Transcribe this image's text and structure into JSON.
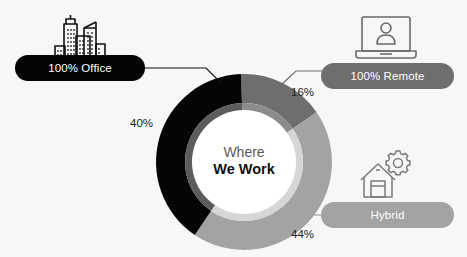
{
  "colors": {
    "office": "#050505",
    "remote": "#6e6e6e",
    "hybrid": "#a3a3a3",
    "inner_office": "#5c5c5c",
    "inner_remote": "#8c8c8c",
    "inner_hybrid": "#d6d6d6",
    "background": "#f7f7f7",
    "icon": "#6a6a6a",
    "icon_office": "#111111"
  },
  "center": {
    "line1": "Where",
    "line2": "We Work"
  },
  "categories": [
    {
      "key": "office",
      "label": "100% Office",
      "percent_label": "40%",
      "icon": "city-buildings-icon"
    },
    {
      "key": "remote",
      "label": "100% Remote",
      "percent_label": "16%",
      "icon": "laptop-user-icon"
    },
    {
      "key": "hybrid",
      "label": "Hybrid",
      "percent_label": "44%",
      "icon": "house-gear-icon"
    }
  ],
  "chart_data": {
    "type": "pie",
    "subtype": "donut",
    "title": "Where We Work",
    "categories": [
      "100% Remote",
      "Hybrid",
      "100% Office"
    ],
    "values": [
      16,
      44,
      40
    ],
    "unit": "%",
    "legend_position": "callout labels with icons",
    "start_angle_deg": -2,
    "direction": "clockwise"
  }
}
